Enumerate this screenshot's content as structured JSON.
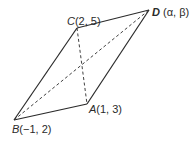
{
  "diagram": {
    "type": "parallelogram",
    "title": "",
    "points": {
      "A": {
        "name": "A",
        "coords": "(1, 3)",
        "px": [
          87,
          104
        ]
      },
      "B": {
        "name": "B",
        "coords": "(−1, 2)",
        "px": [
          14,
          120
        ]
      },
      "C": {
        "name": "C",
        "coords": "(2, 5)",
        "px": [
          77,
          28
        ]
      },
      "D": {
        "name": "D",
        "coords": " (α, β)",
        "px": [
          149,
          10
        ]
      }
    },
    "edges": [
      {
        "from": "B",
        "to": "A",
        "style": "solid"
      },
      {
        "from": "A",
        "to": "D",
        "style": "solid"
      },
      {
        "from": "D",
        "to": "C",
        "style": "solid"
      },
      {
        "from": "C",
        "to": "B",
        "style": "solid"
      }
    ],
    "diagonals": [
      {
        "from": "B",
        "to": "D",
        "style": "dashed"
      },
      {
        "from": "C",
        "to": "A",
        "style": "dashed"
      }
    ],
    "colors": {
      "line": "#2a2a2a",
      "background": "#ffffff"
    }
  }
}
